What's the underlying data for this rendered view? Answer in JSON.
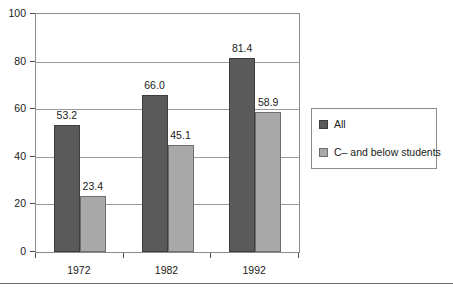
{
  "chart_data": {
    "type": "bar",
    "title": "",
    "subtitle": "",
    "xlabel": "",
    "ylabel": "",
    "categories": [
      "1972",
      "1982",
      "1992"
    ],
    "series": [
      {
        "name": "All",
        "values": [
          53.2,
          66.0,
          81.4
        ],
        "color": "#5a5a5a"
      },
      {
        "name": "C– and below students",
        "values": [
          23.4,
          45.1,
          58.9
        ],
        "color": "#a9a9a9"
      }
    ],
    "value_labels": [
      [
        "53.2",
        "66.0",
        "81.4"
      ],
      [
        "23.4",
        "45.1",
        "58.9"
      ]
    ],
    "ylim": [
      0,
      100
    ],
    "yticks": [
      0,
      20,
      40,
      60,
      80,
      100
    ],
    "ytick_labels": [
      "0",
      "20",
      "40",
      "60",
      "80",
      "100"
    ],
    "grid": "horizontal",
    "legend_position": "right",
    "legend_entries": [
      "All",
      "C– and below students"
    ],
    "frame": true,
    "data_labels_shown": true
  },
  "colors": {
    "series_all": "#5a5a5a",
    "series_c_below": "#a9a9a9",
    "axis": "#8c8c8c",
    "grid": "#9a9a9a",
    "text": "#1a1a1a",
    "background": "#ffffff"
  }
}
